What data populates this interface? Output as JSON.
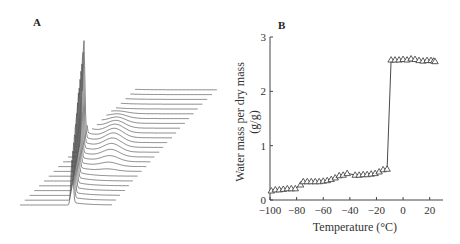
{
  "figure": {
    "panel_a": {
      "label": "A"
    },
    "panel_b": {
      "label": "B"
    }
  },
  "chart_data": [
    {
      "panel": "A",
      "type": "line",
      "title": "",
      "description": "Stacked waterfall plot of ~25 spectra offset diagonally; a tall sharp peak on the left and a broad weaker shoulder that fades across successive traces",
      "xlabel": "",
      "ylabel": "",
      "grid": false,
      "legend": null,
      "series_count": 25
    },
    {
      "panel": "B",
      "type": "line",
      "title": "",
      "xlabel": "Temperature (°C)",
      "ylabel": "Water mass per dry mass (g/g)",
      "xlim": [
        -100,
        30
      ],
      "ylim": [
        0,
        3
      ],
      "xticks": [
        -100,
        -80,
        -60,
        -40,
        -20,
        0,
        20
      ],
      "xtick_labels": [
        "−100",
        "−80",
        "−60",
        "−40",
        "−20",
        "0",
        "20"
      ],
      "yticks": [
        0,
        1,
        2,
        3
      ],
      "ytick_labels": [
        "0",
        "1",
        "2",
        "3"
      ],
      "grid": false,
      "legend": null,
      "marker": "open-triangle",
      "series": [
        {
          "name": "water content",
          "x": [
            -99,
            -96,
            -93,
            -90,
            -87,
            -84,
            -81,
            -77,
            -75,
            -72,
            -69,
            -66,
            -63,
            -60,
            -57,
            -54,
            -51,
            -48,
            -45,
            -42,
            -36,
            -33,
            -30,
            -27,
            -24,
            -21,
            -18,
            -15,
            -12,
            -9,
            -6,
            -3,
            0,
            3,
            6,
            9,
            12,
            15,
            18,
            21,
            23,
            24
          ],
          "values": [
            0.17,
            0.19,
            0.19,
            0.2,
            0.21,
            0.21,
            0.21,
            0.28,
            0.34,
            0.34,
            0.34,
            0.34,
            0.34,
            0.35,
            0.36,
            0.38,
            0.41,
            0.45,
            0.46,
            0.49,
            0.46,
            0.46,
            0.47,
            0.47,
            0.48,
            0.49,
            0.52,
            0.56,
            0.57,
            2.58,
            2.58,
            2.58,
            2.59,
            2.58,
            2.6,
            2.59,
            2.57,
            2.56,
            2.57,
            2.57,
            2.56,
            2.55
          ]
        }
      ]
    }
  ],
  "axis_b": {
    "xlabel": "Temperature (°C)",
    "ylabel_line1": "Water mass per dry mass",
    "ylabel_line2": "(g/g)",
    "xtick_labels": [
      "−100",
      "−80",
      "−60",
      "−40",
      "−20",
      "0",
      "20"
    ],
    "ytick_labels": [
      "0",
      "1",
      "2",
      "3"
    ]
  },
  "colors": {
    "line": "#333333",
    "axis": "#444444",
    "text": "#333333"
  }
}
